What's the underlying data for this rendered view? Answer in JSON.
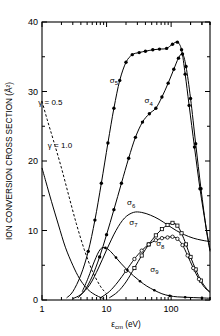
{
  "chart_data": {
    "type": "line",
    "title": "",
    "xlabel": "εcm (eV)",
    "xlabel_base": "ε",
    "xlabel_sub": "cm",
    "xlabel_unit": " (eV)",
    "ylabel": "ION CONVERSION CROSS SECTION (Å²)",
    "xscale": "log",
    "yscale": "linear",
    "xlim": [
      1,
      400
    ],
    "ylim": [
      0,
      40
    ],
    "xticks": [
      1,
      10,
      100
    ],
    "xticklabels": [
      "1",
      "10",
      "100"
    ],
    "yticks": [
      0,
      10,
      20,
      30,
      40
    ],
    "yticklabels": [
      "0",
      "10",
      "20",
      "30",
      "40"
    ],
    "grid": false,
    "legend": "inline-curve-labels",
    "annotations": [
      {
        "text": "γ = 0.5",
        "x": 1.35,
        "y": 28.0
      },
      {
        "text": "γ = 1.0",
        "x": 1.9,
        "y": 21.8
      },
      {
        "text": "σ5",
        "x": 13.0,
        "y": 31.2,
        "base": "σ",
        "sub": "5"
      },
      {
        "text": "σ4",
        "x": 45.0,
        "y": 28.3,
        "base": "σ",
        "sub": "4"
      },
      {
        "text": "σ6",
        "x": 24.0,
        "y": 13.6,
        "base": "σ",
        "sub": "6"
      },
      {
        "text": "σ7",
        "x": 26.0,
        "y": 10.8,
        "base": "σ",
        "sub": "7"
      },
      {
        "text": "σ8",
        "x": 68.0,
        "y": 7.7,
        "base": "σ",
        "sub": "8"
      },
      {
        "text": "σ9",
        "x": 55.0,
        "y": 4.1,
        "base": "σ",
        "sub": "9"
      }
    ],
    "series": [
      {
        "name": "γ = 0.5",
        "style": "dashed",
        "marker": "none",
        "x": [
          1.0,
          1.2,
          1.5,
          2.0,
          2.6,
          3.4,
          4.5,
          6.0,
          8.0,
          10.0
        ],
        "y": [
          28.6,
          26.0,
          23.0,
          19.0,
          15.0,
          11.0,
          7.3,
          4.2,
          2.0,
          0.9
        ]
      },
      {
        "name": "γ = 1.0",
        "style": "solid",
        "marker": "none",
        "x": [
          1.0,
          1.15,
          1.4,
          1.8,
          2.3,
          3.0,
          3.8,
          4.8,
          6.0,
          7.5,
          9.0
        ],
        "y": [
          19.0,
          17.0,
          14.2,
          10.8,
          7.6,
          5.0,
          3.1,
          1.8,
          1.0,
          0.5,
          0.2
        ]
      },
      {
        "name": "σ5",
        "style": "solid",
        "marker": "filled",
        "x": [
          2.4,
          3.0,
          4.0,
          5.2,
          6.6,
          8.3,
          10.5,
          13.0,
          16.0,
          20.0,
          25.0,
          32.0,
          40.0,
          52.0,
          66.0,
          85.0,
          105.0,
          125.0,
          145.0,
          165.0,
          190.0,
          230.0,
          280.0,
          340.0,
          400.0
        ],
        "y": [
          0.3,
          1.2,
          3.6,
          7.0,
          11.5,
          16.8,
          22.6,
          27.6,
          31.6,
          34.2,
          35.3,
          35.6,
          35.8,
          36.0,
          36.1,
          36.2,
          36.8,
          37.1,
          36.0,
          32.5,
          28.0,
          22.0,
          16.0,
          11.0,
          7.2
        ]
      },
      {
        "name": "σ4",
        "style": "solid",
        "marker": "filled",
        "x": [
          3.6,
          4.6,
          6.0,
          7.8,
          10.0,
          13.0,
          17.0,
          22.0,
          28.0,
          36.0,
          46.0,
          58.0,
          72.0,
          90.0,
          110.0,
          130.0,
          150.0,
          170.0,
          200.0,
          240.0,
          290.0,
          350.0,
          400.0
        ],
        "y": [
          0.3,
          1.4,
          3.4,
          6.2,
          9.4,
          13.0,
          16.8,
          20.4,
          23.4,
          25.6,
          26.8,
          27.6,
          29.2,
          31.2,
          33.2,
          34.8,
          35.4,
          33.6,
          29.0,
          22.5,
          16.0,
          10.2,
          7.0
        ]
      },
      {
        "name": "σ6",
        "style": "solid",
        "marker": "none",
        "x": [
          3.0,
          4.0,
          5.5,
          7.5,
          10.0,
          14.0,
          19.0,
          26.0,
          35.0,
          48.0,
          65.0,
          88.0,
          120.0,
          160.0,
          220.0,
          300.0,
          400.0
        ],
        "y": [
          0.2,
          0.8,
          2.2,
          4.6,
          7.2,
          10.0,
          11.8,
          12.6,
          12.6,
          12.2,
          11.6,
          10.8,
          10.0,
          9.4,
          8.9,
          8.6,
          8.4
        ]
      },
      {
        "name": "σ7",
        "style": "solid",
        "marker": "open-square",
        "x": [
          11.0,
          15.0,
          20.0,
          27.0,
          35.0,
          45.0,
          58.0,
          72.0,
          88.0,
          105.0,
          125.0,
          145.0,
          170.0,
          200.0,
          240.0,
          290.0,
          350.0,
          400.0
        ],
        "y": [
          0.3,
          1.2,
          2.6,
          4.6,
          6.4,
          8.0,
          9.3,
          10.2,
          10.8,
          11.1,
          10.7,
          9.6,
          8.0,
          6.2,
          4.4,
          2.8,
          1.7,
          1.2
        ]
      },
      {
        "name": "σ8",
        "style": "solid",
        "marker": "open-circle",
        "x": [
          8.0,
          11.0,
          15.0,
          20.0,
          27.0,
          35.0,
          45.0,
          58.0,
          72.0,
          88.0,
          105.0,
          125.0,
          150.0,
          180.0,
          220.0,
          270.0,
          330.0,
          400.0
        ],
        "y": [
          0.3,
          1.2,
          2.6,
          4.2,
          5.9,
          7.1,
          8.0,
          8.6,
          8.9,
          9.0,
          9.1,
          8.8,
          7.9,
          6.4,
          4.6,
          3.0,
          1.8,
          1.1
        ]
      },
      {
        "name": "σ9",
        "style": "solid",
        "marker": "filled-small",
        "x": [
          4.2,
          5.2,
          6.5,
          8.0,
          9.6,
          11.5,
          14.0,
          17.0,
          21.0,
          26.0,
          33.0,
          42.0,
          55.0,
          72.0,
          95.0,
          125.0,
          165.0,
          220.0,
          300.0,
          400.0
        ],
        "y": [
          1.2,
          3.2,
          5.6,
          7.3,
          7.5,
          7.0,
          6.1,
          5.2,
          4.3,
          3.5,
          2.7,
          2.0,
          1.4,
          0.9,
          0.6,
          0.45,
          0.4,
          0.35,
          0.3,
          0.25
        ]
      }
    ],
    "points": [
      {
        "series": "σ5",
        "marker": "filled",
        "x": [
          5.2,
          6.6,
          8.3,
          10.5,
          13.0,
          16.0,
          20.0,
          25.0,
          32.0,
          40.0,
          52.0,
          66.0,
          85.0,
          105.0,
          125.0,
          145.0,
          165.0,
          190.0,
          230.0,
          280.0
        ],
        "y": [
          7.0,
          11.5,
          16.8,
          22.6,
          27.6,
          31.6,
          34.2,
          35.3,
          35.6,
          35.8,
          36.0,
          36.1,
          36.2,
          36.8,
          37.1,
          36.0,
          32.5,
          28.0,
          22.0,
          16.0
        ]
      },
      {
        "series": "σ4",
        "marker": "filled",
        "x": [
          7.8,
          10.0,
          13.0,
          17.0,
          22.0,
          28.0,
          36.0,
          46.0,
          58.0,
          72.0,
          90.0,
          110.0,
          130.0,
          150.0,
          170.0,
          200.0,
          240.0,
          290.0
        ],
        "y": [
          6.2,
          9.4,
          13.0,
          16.8,
          20.4,
          23.4,
          25.6,
          26.8,
          27.6,
          29.2,
          31.2,
          33.2,
          34.8,
          35.4,
          33.6,
          29.0,
          22.5,
          16.0
        ]
      },
      {
        "series": "σ7",
        "marker": "open-square",
        "x": [
          27.0,
          35.0,
          45.0,
          58.0,
          72.0,
          88.0,
          105.0,
          125.0,
          145.0,
          170.0,
          200.0,
          240.0,
          290.0
        ],
        "y": [
          4.6,
          6.4,
          8.0,
          9.3,
          10.2,
          10.8,
          11.1,
          10.7,
          9.6,
          8.0,
          6.2,
          4.4,
          2.8
        ]
      },
      {
        "series": "σ8",
        "marker": "open-circle",
        "x": [
          20.0,
          27.0,
          35.0,
          45.0,
          58.0,
          72.0,
          88.0,
          105.0,
          125.0,
          150.0,
          180.0,
          220.0,
          270.0
        ],
        "y": [
          4.2,
          5.9,
          7.1,
          8.0,
          8.6,
          8.9,
          9.0,
          9.1,
          8.8,
          7.9,
          6.4,
          4.6,
          3.0
        ]
      },
      {
        "series": "σ9",
        "marker": "filled-small",
        "x": [
          9.6,
          14.0,
          21.0,
          33.0,
          55.0,
          95.0,
          165.0,
          300.0
        ],
        "y": [
          7.5,
          6.1,
          4.3,
          2.7,
          1.4,
          0.6,
          0.4,
          0.3
        ]
      }
    ]
  }
}
